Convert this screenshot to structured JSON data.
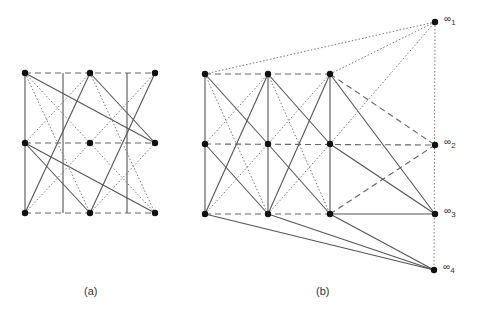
{
  "figure": {
    "panel_a": {
      "caption": "(a)",
      "vertices": [
        {
          "id": "a00",
          "x": 25,
          "y": 73
        },
        {
          "id": "a01",
          "x": 90,
          "y": 73
        },
        {
          "id": "a02",
          "x": 155,
          "y": 73
        },
        {
          "id": "a10",
          "x": 25,
          "y": 143
        },
        {
          "id": "a11",
          "x": 90,
          "y": 143
        },
        {
          "id": "a12",
          "x": 155,
          "y": 143
        },
        {
          "id": "a20",
          "x": 25,
          "y": 213
        },
        {
          "id": "a21",
          "x": 90,
          "y": 213
        },
        {
          "id": "a22",
          "x": 155,
          "y": 213
        }
      ]
    },
    "panel_b": {
      "caption": "(b)",
      "vertices": [
        {
          "id": "b00",
          "x": 205,
          "y": 74
        },
        {
          "id": "b01",
          "x": 268,
          "y": 74
        },
        {
          "id": "b02",
          "x": 330,
          "y": 74
        },
        {
          "id": "b10",
          "x": 205,
          "y": 144
        },
        {
          "id": "b11",
          "x": 268,
          "y": 144
        },
        {
          "id": "b12",
          "x": 330,
          "y": 144
        },
        {
          "id": "b20",
          "x": 205,
          "y": 214
        },
        {
          "id": "b21",
          "x": 268,
          "y": 214
        },
        {
          "id": "b22",
          "x": 330,
          "y": 214
        }
      ],
      "infinity_points": [
        {
          "id": "inf1",
          "label": "∞",
          "sub": "1",
          "x": 435,
          "y": 22
        },
        {
          "id": "inf2",
          "label": "∞",
          "sub": "2",
          "x": 435,
          "y": 145
        },
        {
          "id": "inf3",
          "label": "∞",
          "sub": "3",
          "x": 435,
          "y": 214
        },
        {
          "id": "inf4",
          "label": "∞",
          "sub": "4",
          "x": 434,
          "y": 270
        }
      ]
    },
    "legend_styles": {
      "solid": "solid edge",
      "dashed": "dashed edge",
      "dotted": "dotted edge"
    }
  }
}
